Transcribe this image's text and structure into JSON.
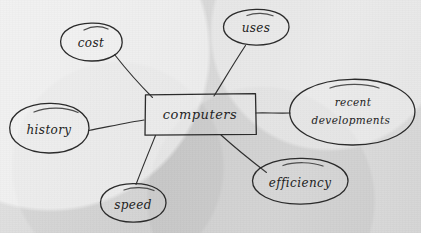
{
  "diagram": {
    "kind": "concept-map",
    "medium": "handwritten-pencil-on-paper",
    "background_color": "#dcdcdc",
    "ink_color": "#2b2b2b",
    "center": {
      "label": "computers",
      "shape": "rectangle",
      "x": 200,
      "y": 114,
      "width": 112,
      "height": 42
    },
    "nodes": [
      {
        "id": "cost",
        "label": "cost",
        "shape": "ellipse",
        "cx": 91,
        "cy": 42,
        "rx": 31,
        "ry": 19,
        "lines": [
          "cost"
        ]
      },
      {
        "id": "uses",
        "label": "uses",
        "shape": "ellipse",
        "cx": 256,
        "cy": 27,
        "rx": 33,
        "ry": 18,
        "lines": [
          "uses"
        ]
      },
      {
        "id": "recent-developments",
        "label": "recent developments",
        "shape": "ellipse",
        "cx": 352,
        "cy": 112,
        "rx": 63,
        "ry": 33,
        "lines": [
          "recent",
          "developments"
        ]
      },
      {
        "id": "history",
        "label": "history",
        "shape": "ellipse",
        "cx": 49,
        "cy": 128,
        "rx": 40,
        "ry": 25,
        "lines": [
          "history"
        ]
      },
      {
        "id": "speed",
        "label": "speed",
        "shape": "ellipse",
        "cx": 133,
        "cy": 203,
        "rx": 33,
        "ry": 19,
        "lines": [
          "speed"
        ]
      },
      {
        "id": "efficiency",
        "label": "efficiency",
        "shape": "ellipse",
        "cx": 300,
        "cy": 181,
        "rx": 48,
        "ry": 23,
        "lines": [
          "efficiency"
        ]
      }
    ],
    "edges": [
      {
        "id": "edge-cost",
        "from": "computers",
        "to": "cost",
        "x1": 152,
        "y1": 97,
        "x2": 114,
        "y2": 54
      },
      {
        "id": "edge-uses",
        "from": "computers",
        "to": "uses",
        "x1": 214,
        "y1": 96,
        "x2": 245,
        "y2": 45
      },
      {
        "id": "edge-recent",
        "from": "computers",
        "to": "recent-developments",
        "x1": 256,
        "y1": 113,
        "x2": 290,
        "y2": 113
      },
      {
        "id": "edge-history",
        "from": "computers",
        "to": "history",
        "x1": 144,
        "y1": 120,
        "x2": 88,
        "y2": 130
      },
      {
        "id": "edge-speed",
        "from": "computers",
        "to": "speed",
        "x1": 155,
        "y1": 135,
        "x2": 136,
        "y2": 184
      },
      {
        "id": "edge-efficiency",
        "from": "computers",
        "to": "efficiency",
        "x1": 221,
        "y1": 135,
        "x2": 266,
        "y2": 172
      }
    ]
  }
}
